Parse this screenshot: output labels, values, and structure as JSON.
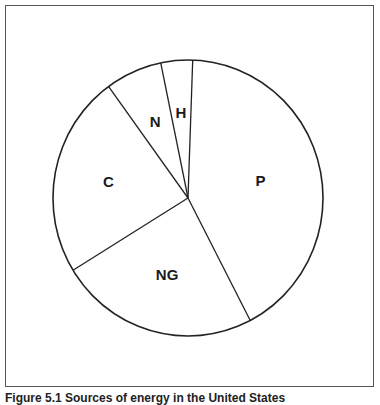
{
  "chart_data": {
    "type": "pie",
    "title": "",
    "start_angle_deg": 2,
    "direction": "clockwise",
    "slices": [
      {
        "label": "P",
        "value": 41.9
      },
      {
        "label": "NG",
        "value": 23.9
      },
      {
        "label": "C",
        "value": 23.8
      },
      {
        "label": "N",
        "value": 6.8
      },
      {
        "label": "H",
        "value": 3.8
      }
    ],
    "units": "percent (estimated from slice angles)",
    "legend": "none (labels inside slices)",
    "colors": {
      "fill": "#ffffff",
      "stroke": "#222222"
    }
  },
  "caption": "Figure 5.1  Sources of energy in the United States"
}
